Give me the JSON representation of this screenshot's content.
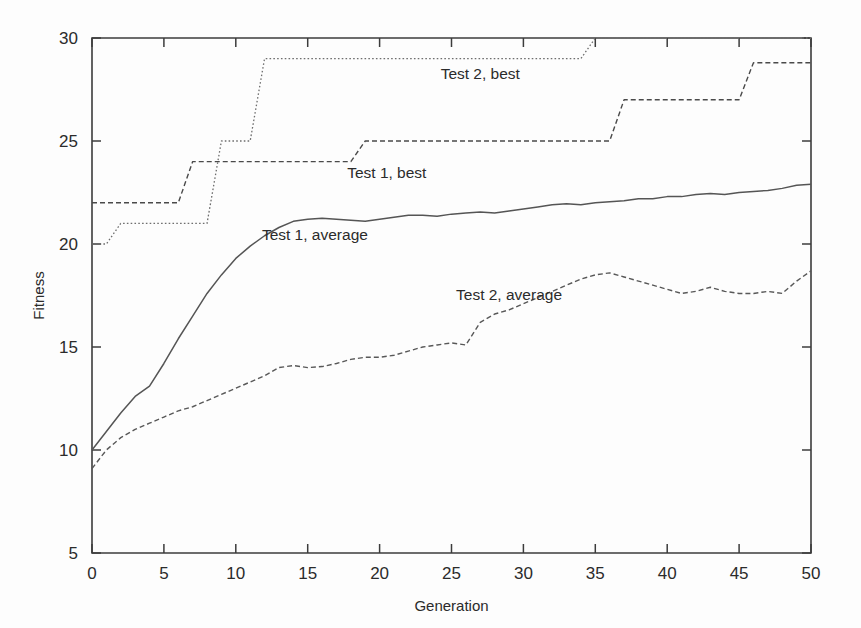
{
  "chart_data": {
    "type": "line",
    "title": "",
    "xlabel": "Generation",
    "ylabel": "Fitness",
    "xlim": [
      0,
      50
    ],
    "ylim": [
      5,
      30
    ],
    "xticks": [
      0,
      5,
      10,
      15,
      20,
      25,
      30,
      35,
      40,
      45,
      50
    ],
    "yticks": [
      5,
      10,
      15,
      20,
      25,
      30
    ],
    "xtick_labels": [
      "0",
      "5",
      "10",
      "15",
      "20",
      "25",
      "30",
      "35",
      "40",
      "45",
      "50"
    ],
    "ytick_labels": [
      "5",
      "10",
      "15",
      "20",
      "25",
      "30"
    ],
    "grid": false,
    "legend_position": "inline-annotations",
    "x": [
      0,
      1,
      2,
      3,
      4,
      5,
      6,
      7,
      8,
      9,
      10,
      11,
      12,
      13,
      14,
      15,
      16,
      17,
      18,
      19,
      20,
      21,
      22,
      23,
      24,
      25,
      26,
      27,
      28,
      29,
      30,
      31,
      32,
      33,
      34,
      35,
      36,
      37,
      38,
      39,
      40,
      41,
      42,
      43,
      44,
      45,
      46,
      47,
      48,
      49,
      50
    ],
    "series": [
      {
        "name": "Test 1, best",
        "label": "Test 1, best",
        "style": "dashed",
        "color": "#4a4a4a",
        "label_x": 20.5,
        "label_y": 23.2,
        "values": [
          22,
          22,
          22,
          22,
          22,
          22,
          22,
          24,
          24,
          24,
          24,
          24,
          24,
          24,
          24,
          24,
          24,
          24,
          24,
          25,
          25,
          25,
          25,
          25,
          25,
          25,
          25,
          25,
          25,
          25,
          25,
          25,
          25,
          25,
          25,
          25,
          25,
          27,
          27,
          27,
          27,
          27,
          27,
          27,
          27,
          27,
          28.8,
          28.8,
          28.8,
          28.8,
          28.8
        ]
      },
      {
        "name": "Test 2, best",
        "label": "Test 2, best",
        "style": "dotted",
        "color": "#6e6e6e",
        "label_x": 27.0,
        "label_y": 28.0,
        "values": [
          20,
          20,
          21,
          21,
          21,
          21,
          21,
          21,
          21,
          25,
          25,
          25,
          29,
          29,
          29,
          29,
          29,
          29,
          29,
          29,
          29,
          29,
          29,
          29,
          29,
          29,
          29,
          29,
          29,
          29,
          29,
          29,
          29,
          29,
          29,
          30,
          30,
          30,
          30,
          30,
          30,
          30,
          30,
          30,
          30,
          30,
          30,
          30,
          30,
          30,
          30
        ]
      },
      {
        "name": "Test 1, average",
        "label": "Test 1, average",
        "style": "solid",
        "color": "#555555",
        "label_x": 15.5,
        "label_y": 20.2,
        "values": [
          10.0,
          10.9,
          11.8,
          12.6,
          13.1,
          14.2,
          15.4,
          16.5,
          17.6,
          18.5,
          19.3,
          19.9,
          20.4,
          20.8,
          21.1,
          21.2,
          21.25,
          21.2,
          21.15,
          21.1,
          21.2,
          21.3,
          21.4,
          21.4,
          21.35,
          21.45,
          21.5,
          21.55,
          21.5,
          21.6,
          21.7,
          21.8,
          21.9,
          21.95,
          21.9,
          22.0,
          22.05,
          22.1,
          22.2,
          22.2,
          22.3,
          22.3,
          22.4,
          22.45,
          22.4,
          22.5,
          22.55,
          22.6,
          22.7,
          22.85,
          22.9
        ]
      },
      {
        "name": "Test 2, average",
        "label": "Test 2, average",
        "style": "dashed",
        "color": "#585858",
        "label_x": 29.0,
        "label_y": 17.3,
        "values": [
          9.1,
          10.0,
          10.6,
          11.0,
          11.3,
          11.6,
          11.9,
          12.1,
          12.4,
          12.7,
          13.0,
          13.3,
          13.6,
          14.0,
          14.1,
          14.0,
          14.05,
          14.2,
          14.4,
          14.5,
          14.5,
          14.6,
          14.8,
          15.0,
          15.1,
          15.2,
          15.1,
          16.2,
          16.6,
          16.8,
          17.1,
          17.4,
          17.7,
          18.0,
          18.3,
          18.5,
          18.6,
          18.4,
          18.2,
          18.0,
          17.8,
          17.6,
          17.7,
          17.9,
          17.7,
          17.6,
          17.6,
          17.7,
          17.6,
          18.2,
          18.7
        ]
      }
    ]
  }
}
